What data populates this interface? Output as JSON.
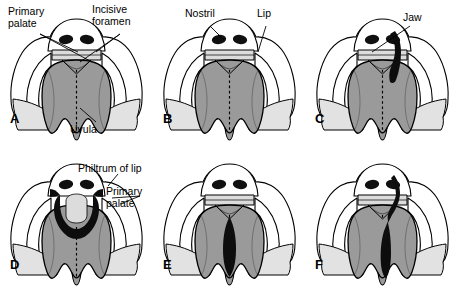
{
  "figure": {
    "width": 460,
    "height": 290
  },
  "colors": {
    "background": "#ffffff",
    "ink": "#000000",
    "palate_fill": "#9a9a9a",
    "palate_fill_light": "#b4b4b4",
    "cheek_fill": "#ffffff",
    "jaw_fill": "#e2e2e2",
    "cleft_black": "#0d0d0d",
    "nostril_black": "#101010",
    "lip_fill": "#dcdcdc"
  },
  "panels": [
    {
      "id": "A",
      "letter": "A",
      "name": "normal-palate",
      "caption": "Normal lip and palate",
      "annotations": [
        {
          "id": "primary-palate",
          "text": "Primary\npalate",
          "x": 8,
          "y": 6
        },
        {
          "id": "incisive-foramen",
          "text": "Incisive\nforamen",
          "x": 92,
          "y": 4
        },
        {
          "id": "uvula",
          "text": "Uvula",
          "x": 70,
          "y": 124
        }
      ]
    },
    {
      "id": "B",
      "letter": "B",
      "name": "unilateral-cleft-lip",
      "caption": "Unilateral cleft lip",
      "annotations": [
        {
          "id": "nostril",
          "text": "Nostril",
          "x": 185,
          "y": 8
        },
        {
          "id": "lip",
          "text": "Lip",
          "x": 257,
          "y": 8
        }
      ]
    },
    {
      "id": "C",
      "letter": "C",
      "name": "unilateral-cleft-lip-and-jaw",
      "caption": "Unilateral cleft lip extending into the jaw",
      "annotations": [
        {
          "id": "jaw",
          "text": "Jaw",
          "x": 403,
          "y": 12
        }
      ]
    },
    {
      "id": "D",
      "letter": "D",
      "name": "bilateral-cleft-lip",
      "caption": "Bilateral cleft lip with isolated philtrum",
      "annotations": [
        {
          "id": "philtrum-of-lip",
          "text": "Philtrum of lip",
          "x": 78,
          "y": 163
        },
        {
          "id": "primary-palate-d",
          "text": "Primary\npalate",
          "x": 106,
          "y": 186
        }
      ]
    },
    {
      "id": "E",
      "letter": "E",
      "name": "isolated-cleft-palate",
      "caption": "Isolated cleft of the secondary palate",
      "annotations": []
    },
    {
      "id": "F",
      "letter": "F",
      "name": "complete-cleft-lip-and-palate",
      "caption": "Complete unilateral cleft lip and palate",
      "annotations": []
    }
  ]
}
